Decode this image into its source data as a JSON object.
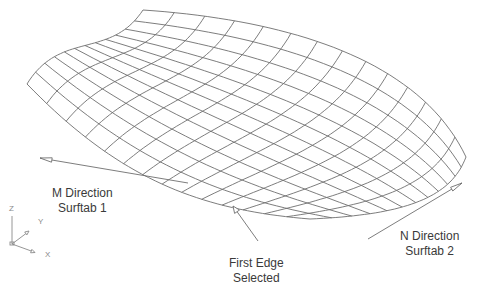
{
  "figure": {
    "background": "#ffffff",
    "mesh_color": "#6e6e6e",
    "text_color": "#3a3a3a"
  },
  "mesh": {
    "m_divisions": 14,
    "n_divisions": 12,
    "corners": {
      "back_left": [
        143,
        10
      ],
      "left": [
        27,
        84
      ],
      "front": [
        310,
        219
      ],
      "right": [
        466,
        157
      ]
    },
    "edges": {
      "left_edge_ctrl": [
        [
          27,
          84
        ],
        [
          60,
          30
        ],
        [
          110,
          60
        ],
        [
          143,
          10
        ]
      ],
      "front_edge_ctrl": [
        [
          27,
          84
        ],
        [
          120,
          180
        ],
        [
          200,
          210
        ],
        [
          310,
          219
        ]
      ],
      "right_edge_ctrl": [
        [
          310,
          219
        ],
        [
          400,
          215
        ],
        [
          450,
          200
        ],
        [
          466,
          157
        ]
      ],
      "back_edge_ctrl": [
        [
          143,
          10
        ],
        [
          290,
          20
        ],
        [
          420,
          60
        ],
        [
          466,
          157
        ]
      ]
    }
  },
  "annotations": {
    "m_direction": {
      "line1": "M Direction",
      "line2": "Surftab 1"
    },
    "n_direction": {
      "line1": "N Direction",
      "line2": "Surftab 2"
    },
    "first_edge": {
      "line1": "First Edge",
      "line2": "Selected"
    }
  },
  "arrows": {
    "m_arrow": {
      "from": [
        188,
        183
      ],
      "to": [
        40,
        158
      ]
    },
    "n_arrow": {
      "from": [
        368,
        239
      ],
      "to": [
        462,
        183
      ]
    },
    "first_edge_leader": {
      "from": [
        258,
        241
      ],
      "to": [
        233,
        206
      ]
    }
  },
  "ucs_icon": {
    "origin": [
      12,
      244
    ],
    "axes": {
      "z": "Z",
      "y": "Y",
      "x": "X"
    }
  }
}
